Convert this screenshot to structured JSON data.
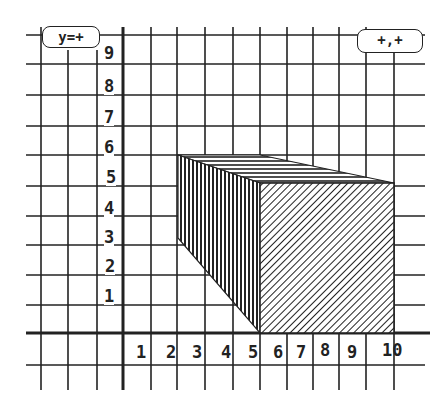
{
  "graph": {
    "equation_label": "y=+",
    "coordinate_label": "+,+",
    "y_ticks": [
      "1",
      "2",
      "3",
      "4",
      "5",
      "6",
      "7",
      "8",
      "9"
    ],
    "x_ticks": [
      "1",
      "2",
      "3",
      "4",
      "5",
      "6",
      "7",
      "8",
      "9",
      "10"
    ]
  },
  "colors": {
    "grid": "#222222",
    "background": "#ffffff",
    "shape_stroke": "#222222"
  }
}
